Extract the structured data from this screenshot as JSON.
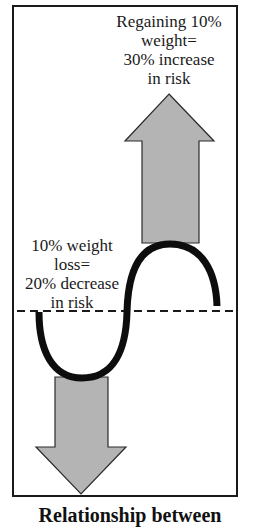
{
  "diagram": {
    "type": "weight-cycling-risk-diagram",
    "up_arrow": {
      "label_lines": [
        "Regaining 10%",
        "weight=",
        "30% increase",
        "in risk"
      ],
      "direction": "up",
      "meaning": "increase in risk"
    },
    "down_arrow": {
      "label_lines": [
        "10% weight",
        "loss=",
        "20% decrease",
        "in risk"
      ],
      "direction": "down",
      "meaning": "decrease in risk"
    },
    "baseline": {
      "style": "dashed",
      "meaning": "baseline risk"
    },
    "curve": {
      "shape": "S-curve (dip below baseline then rise above)"
    },
    "colors": {
      "arrow_fill": "#b4b4b4",
      "arrow_stroke": "#2a2a2a",
      "curve": "#0d0d0d",
      "frame": "#1a1a1a",
      "background": "#ffffff"
    },
    "caption": "Relationship between"
  }
}
